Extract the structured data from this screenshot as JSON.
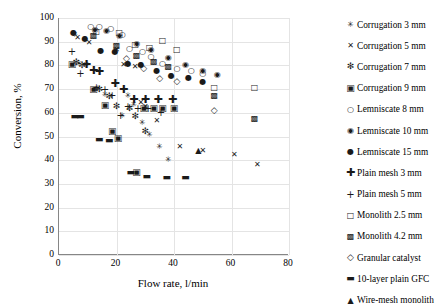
{
  "chart_data": {
    "type": "scatter",
    "title": "",
    "xlabel": "Flow rate, l/min",
    "ylabel": "Conversion, %",
    "xlim": [
      0,
      80
    ],
    "ylim": [
      0,
      100
    ],
    "xticks": [
      0,
      20,
      40,
      60,
      80
    ],
    "yticks": [
      0,
      10,
      20,
      30,
      40,
      50,
      60,
      70,
      80,
      90,
      100
    ],
    "grid": "horizontal-and-vertical",
    "legend_position": "right",
    "series": [
      {
        "name": "Corrugation 3 mm",
        "marker": "asterisk-small",
        "glyph": "✳",
        "points": [
          [
            5.5,
            93.0
          ],
          [
            7.0,
            80.5
          ],
          [
            9.5,
            80.0
          ],
          [
            13.5,
            70.0
          ],
          [
            16.0,
            67.5
          ],
          [
            22.0,
            58.5
          ],
          [
            24.0,
            67.0
          ],
          [
            26.0,
            63.5
          ],
          [
            29.0,
            55.5
          ],
          [
            31.5,
            50.5
          ],
          [
            35.0,
            45.5
          ],
          [
            38.0,
            40.0
          ]
        ]
      },
      {
        "name": "Corrugation 5 mm",
        "marker": "cross-x",
        "glyph": "✕",
        "points": [
          [
            6.5,
            91.5
          ],
          [
            10.5,
            89.5
          ],
          [
            20.0,
            86.5
          ],
          [
            22.5,
            80.0
          ],
          [
            26.5,
            79.5
          ],
          [
            28.5,
            64.0
          ],
          [
            30.0,
            62.5
          ],
          [
            34.0,
            56.5
          ],
          [
            42.0,
            45.5
          ],
          [
            50.0,
            44.0
          ],
          [
            61.0,
            42.0
          ],
          [
            69.0,
            38.0
          ]
        ]
      },
      {
        "name": "Corrugation 7 mm",
        "marker": "asterisk-bold",
        "glyph": "✻",
        "points": [
          [
            6.0,
            81.5
          ],
          [
            8.0,
            80.0
          ],
          [
            14.0,
            70.0
          ],
          [
            17.5,
            67.0
          ],
          [
            20.0,
            63.0
          ],
          [
            24.5,
            62.0
          ],
          [
            26.5,
            58.5
          ],
          [
            30.0,
            52.5
          ]
        ]
      },
      {
        "name": "Corrugation 9 mm",
        "marker": "square-filled-split",
        "glyph": "▣",
        "points": [
          [
            4.5,
            80.5
          ],
          [
            12.0,
            70.0
          ],
          [
            16.0,
            63.5
          ],
          [
            18.5,
            52.5
          ],
          [
            20.5,
            49.5
          ],
          [
            27.0,
            35.0
          ],
          [
            29.5,
            62.0
          ],
          [
            33.0,
            62.0
          ],
          [
            36.0,
            62.0
          ],
          [
            40.0,
            62.0
          ]
        ]
      },
      {
        "name": "Lemniscate 8 mm",
        "marker": "circle-open",
        "glyph": "○",
        "points": [
          [
            11.0,
            96.0
          ],
          [
            14.0,
            96.0
          ],
          [
            18.0,
            95.5
          ],
          [
            22.0,
            93.0
          ],
          [
            24.5,
            87.0
          ],
          [
            29.0,
            85.5
          ],
          [
            32.0,
            83.5
          ],
          [
            36.0,
            80.5
          ],
          [
            41.0,
            78.5
          ],
          [
            46.0,
            77.5
          ],
          [
            50.0,
            76.5
          ]
        ]
      },
      {
        "name": "Lemniscate 10 mm",
        "marker": "circle-dot",
        "glyph": "◉",
        "points": [
          [
            12.5,
            95.0
          ],
          [
            16.5,
            94.5
          ],
          [
            21.0,
            92.5
          ],
          [
            27.0,
            89.0
          ],
          [
            32.0,
            86.5
          ],
          [
            38.0,
            83.0
          ],
          [
            44.0,
            80.0
          ],
          [
            50.0,
            77.5
          ],
          [
            55.0,
            76.0
          ]
        ]
      },
      {
        "name": "Lemniscate 15 mm",
        "marker": "circle-filled",
        "glyph": "●",
        "points": [
          [
            5.0,
            93.5
          ],
          [
            9.0,
            91.0
          ],
          [
            14.5,
            86.0
          ],
          [
            19.5,
            85.5
          ],
          [
            24.0,
            80.5
          ],
          [
            28.5,
            80.0
          ],
          [
            34.0,
            77.5
          ],
          [
            39.0,
            75.5
          ],
          [
            45.0,
            74.5
          ],
          [
            50.0,
            73.0
          ]
        ]
      },
      {
        "name": "Plain mesh 3 mm",
        "marker": "plus-bold",
        "glyph": "✚",
        "points": [
          [
            9.5,
            80.5
          ],
          [
            12.0,
            78.0
          ],
          [
            14.0,
            77.5
          ],
          [
            19.5,
            72.5
          ],
          [
            22.5,
            70.0
          ],
          [
            26.0,
            66.0
          ],
          [
            30.0,
            66.0
          ],
          [
            34.5,
            66.0
          ],
          [
            39.5,
            66.0
          ]
        ]
      },
      {
        "name": "Plain mesh 5 mm",
        "marker": "plus-thin",
        "glyph": "+",
        "points": [
          [
            4.5,
            85.5
          ],
          [
            7.5,
            76.5
          ],
          [
            13.0,
            70.5
          ],
          [
            16.0,
            69.5
          ],
          [
            18.5,
            67.0
          ],
          [
            21.5,
            58.5
          ],
          [
            24.0,
            62.5
          ],
          [
            27.5,
            61.5
          ],
          [
            31.0,
            61.5
          ],
          [
            35.5,
            60.0
          ]
        ]
      },
      {
        "name": "Monolith 2.5 mm",
        "marker": "square-open",
        "glyph": "□",
        "points": [
          [
            13.0,
            94.0
          ],
          [
            21.0,
            93.5
          ],
          [
            26.5,
            88.5
          ],
          [
            31.5,
            87.5
          ],
          [
            36.0,
            90.5
          ],
          [
            41.0,
            86.5
          ],
          [
            54.0,
            70.5
          ],
          [
            68.0,
            70.5
          ]
        ]
      },
      {
        "name": "Monolith 4.2 mm",
        "marker": "square-hatch",
        "glyph": "▩",
        "points": [
          [
            12.0,
            92.5
          ],
          [
            20.0,
            88.0
          ],
          [
            27.0,
            84.0
          ],
          [
            33.0,
            81.5
          ],
          [
            38.0,
            79.5
          ],
          [
            54.0,
            67.0
          ],
          [
            68.0,
            57.5
          ]
        ]
      },
      {
        "name": "Granular catalyst",
        "marker": "diamond-open",
        "glyph": "◇",
        "points": [
          [
            23.5,
            83.0
          ],
          [
            29.5,
            79.0
          ],
          [
            35.0,
            74.5
          ],
          [
            41.0,
            73.5
          ],
          [
            54.0,
            61.0
          ]
        ]
      },
      {
        "name": "10-layer plain GFC",
        "marker": "dash",
        "glyph": "▬",
        "points": [
          [
            5.5,
            58.5
          ],
          [
            7.5,
            58.5
          ],
          [
            14.0,
            49.0
          ],
          [
            17.5,
            48.5
          ],
          [
            25.0,
            35.0
          ],
          [
            30.5,
            33.5
          ],
          [
            37.5,
            33.0
          ],
          [
            44.0,
            33.0
          ]
        ]
      },
      {
        "name": "Wire-mesh monolith",
        "marker": "triangle-filled",
        "glyph": "▲",
        "points": [
          [
            48.5,
            44.0
          ]
        ]
      }
    ]
  }
}
